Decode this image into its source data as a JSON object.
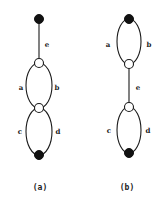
{
  "figure": {
    "panels": [
      {
        "id": "a",
        "caption": "(a)",
        "nodes": [
          {
            "id": "top",
            "type": "filled",
            "x": 39,
            "y": 19
          },
          {
            "id": "mid1",
            "type": "open",
            "x": 39,
            "y": 63
          },
          {
            "id": "mid2",
            "type": "open",
            "x": 39,
            "y": 108
          },
          {
            "id": "bottom",
            "type": "filled",
            "x": 39,
            "y": 155
          }
        ],
        "edges": [
          {
            "label": "e",
            "from": "top",
            "to": "mid1",
            "shape": "line"
          },
          {
            "label": "a",
            "from": "mid1",
            "to": "mid2",
            "shape": "arc-left"
          },
          {
            "label": "b",
            "from": "mid1",
            "to": "mid2",
            "shape": "arc-right"
          },
          {
            "label": "c",
            "from": "mid2",
            "to": "bottom",
            "shape": "arc-left"
          },
          {
            "label": "d",
            "from": "mid2",
            "to": "bottom",
            "shape": "arc-right"
          }
        ],
        "labels": {
          "e": "e",
          "a": "a",
          "b": "b",
          "c": "c",
          "d": "d"
        }
      },
      {
        "id": "b",
        "caption": "(b)",
        "nodes": [
          {
            "id": "top",
            "type": "filled",
            "x": 129,
            "y": 19
          },
          {
            "id": "mid1",
            "type": "open",
            "x": 129,
            "y": 64
          },
          {
            "id": "mid2",
            "type": "open",
            "x": 129,
            "y": 107
          },
          {
            "id": "bottom",
            "type": "filled",
            "x": 129,
            "y": 153
          }
        ],
        "edges": [
          {
            "label": "a",
            "from": "top",
            "to": "mid1",
            "shape": "arc-left"
          },
          {
            "label": "b",
            "from": "top",
            "to": "mid1",
            "shape": "arc-right"
          },
          {
            "label": "e",
            "from": "mid1",
            "to": "mid2",
            "shape": "line"
          },
          {
            "label": "c",
            "from": "mid2",
            "to": "bottom",
            "shape": "arc-left"
          },
          {
            "label": "d",
            "from": "mid2",
            "to": "bottom",
            "shape": "arc-right"
          }
        ],
        "labels": {
          "a": "a",
          "b": "b",
          "e": "e",
          "c": "c",
          "d": "d"
        }
      }
    ]
  }
}
